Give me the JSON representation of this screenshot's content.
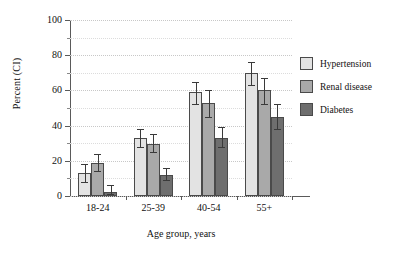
{
  "chart_data": {
    "type": "bar",
    "title": "",
    "subtitle": "",
    "xlabel": "Age group, years",
    "ylabel": "Percent (CI)",
    "categories": [
      "18-24",
      "25-39",
      "40-54",
      "55+"
    ],
    "ylim": [
      0,
      100
    ],
    "yticks": [
      0,
      20,
      40,
      60,
      80,
      100
    ],
    "yticks_minor": [
      10,
      30,
      50,
      70,
      90
    ],
    "ytick_labels": [
      "0",
      "20",
      "40",
      "60",
      "80",
      "100"
    ],
    "grid": true,
    "legend_position": "right",
    "series": [
      {
        "name": "Hypertension",
        "color": "#e3e3e3",
        "values": [
          13,
          33,
          59,
          70
        ],
        "ci_low": [
          8,
          28,
          52,
          63
        ],
        "ci_high": [
          18,
          38,
          65,
          76
        ]
      },
      {
        "name": "Renal disease",
        "color": "#a9a9a9",
        "values": [
          18.5,
          29.5,
          53,
          60
        ],
        "ci_low": [
          14,
          25,
          45,
          52
        ],
        "ci_high": [
          24,
          35,
          60,
          67
        ]
      },
      {
        "name": "Diabetes",
        "color": "#6e6e6e",
        "values": [
          2.5,
          12,
          33,
          45
        ],
        "ci_low": [
          1,
          9,
          28,
          38
        ],
        "ci_high": [
          6,
          16,
          39,
          52
        ]
      }
    ]
  },
  "legend": {
    "items": [
      {
        "label": "Hypertension",
        "color": "#e3e3e3"
      },
      {
        "label": "Renal disease",
        "color": "#a9a9a9"
      },
      {
        "label": "Diabetes",
        "color": "#6e6e6e"
      }
    ]
  },
  "axes": {
    "y_title": "Percent (CI)",
    "x_title": "Age group, years"
  }
}
